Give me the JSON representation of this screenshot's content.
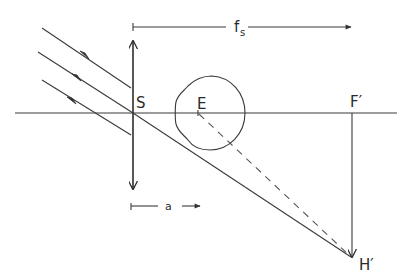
{
  "figure": {
    "labels": {
      "lens": "S",
      "eye": "E",
      "focal_point": "F′",
      "image_point": "H′",
      "focal_length_main": "f",
      "focal_length_sub": "s",
      "eye_distance": "a"
    },
    "elements": [
      "optical-axis",
      "lens-double-arrow",
      "incident-ray-top",
      "incident-ray-middle",
      "incident-ray-bottom",
      "refracted-ray-to-image",
      "eye-outline",
      "dashed-sightline",
      "focal-plane-line",
      "dimension-fs",
      "dimension-a"
    ],
    "colors": {
      "line": "#3a3a3a",
      "background": "#ffffff"
    }
  }
}
